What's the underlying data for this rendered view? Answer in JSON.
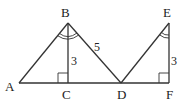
{
  "diagram": {
    "points": {
      "A": {
        "label": "A",
        "x": 19,
        "y": 83
      },
      "B": {
        "label": "B",
        "x": 68,
        "y": 23
      },
      "C": {
        "label": "C",
        "x": 68,
        "y": 83
      },
      "D": {
        "label": "D",
        "x": 121,
        "y": 83
      },
      "E": {
        "label": "E",
        "x": 169,
        "y": 23
      },
      "F": {
        "label": "F",
        "x": 169,
        "y": 83
      }
    },
    "segment_labels": {
      "BD": "5",
      "BC": "3",
      "EF": "3"
    },
    "marks": {
      "right_angle_C": "right-angle",
      "right_angle_F": "right-angle",
      "angle_B": "double-arc",
      "angle_E": "double-arc"
    }
  }
}
